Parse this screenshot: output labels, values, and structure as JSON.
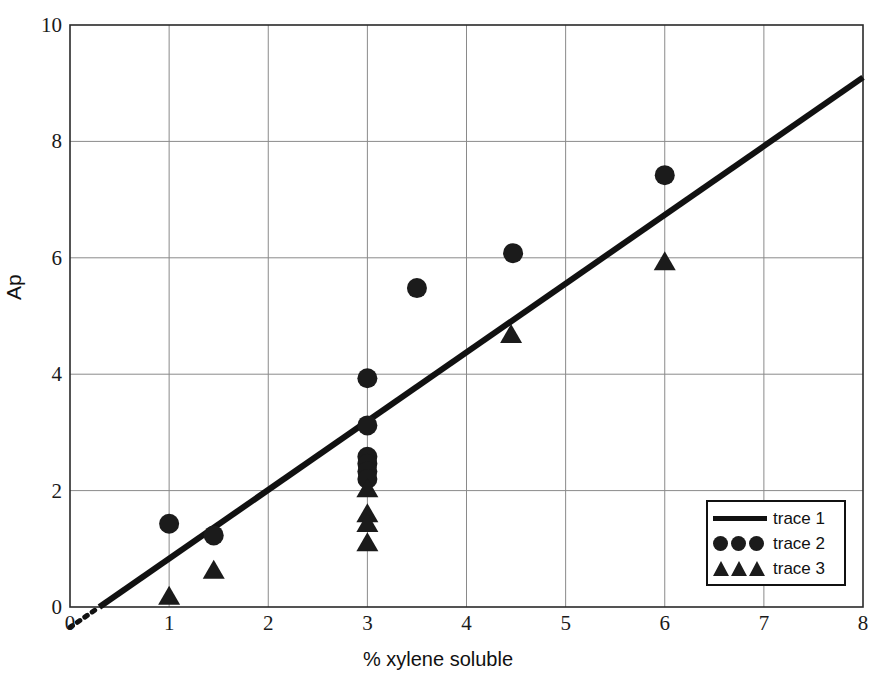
{
  "chart_data": {
    "type": "scatter",
    "title": "",
    "xlabel": "% xylene soluble",
    "ylabel": "Ap",
    "xlim": [
      0,
      8
    ],
    "ylim": [
      0,
      10
    ],
    "xticks": [
      "0",
      "1",
      "2",
      "3",
      "4",
      "5",
      "6",
      "7",
      "8"
    ],
    "yticks": [
      "0",
      "2",
      "4",
      "6",
      "8",
      "10"
    ],
    "grid": true,
    "legend_position": "lower-right",
    "series": [
      {
        "name": "trace 1",
        "type": "line",
        "marker": "line",
        "color": "#111111",
        "points": [
          {
            "x": 0.0,
            "y": -0.35
          },
          {
            "x": 8.0,
            "y": 9.1
          }
        ]
      },
      {
        "name": "trace 2",
        "type": "scatter",
        "marker": "circle",
        "color": "#1b1b1b",
        "points": [
          {
            "x": 1.0,
            "y": 1.43
          },
          {
            "x": 1.45,
            "y": 1.23
          },
          {
            "x": 3.0,
            "y": 3.93
          },
          {
            "x": 3.0,
            "y": 3.12
          },
          {
            "x": 3.0,
            "y": 2.58
          },
          {
            "x": 3.0,
            "y": 2.46
          },
          {
            "x": 3.0,
            "y": 2.33
          },
          {
            "x": 3.0,
            "y": 2.2
          },
          {
            "x": 3.5,
            "y": 5.48
          },
          {
            "x": 4.47,
            "y": 6.08
          },
          {
            "x": 6.0,
            "y": 7.42
          }
        ]
      },
      {
        "name": "trace 3",
        "type": "scatter",
        "marker": "triangle",
        "color": "#1b1b1b",
        "points": [
          {
            "x": 1.0,
            "y": 0.2
          },
          {
            "x": 1.45,
            "y": 0.65
          },
          {
            "x": 3.0,
            "y": 2.05
          },
          {
            "x": 3.0,
            "y": 1.62
          },
          {
            "x": 3.0,
            "y": 1.45
          },
          {
            "x": 3.0,
            "y": 1.12
          },
          {
            "x": 4.45,
            "y": 4.7
          },
          {
            "x": 6.0,
            "y": 5.95
          }
        ]
      }
    ]
  },
  "legend": {
    "entries": [
      {
        "label": "trace 1",
        "key": "line-key"
      },
      {
        "label": "trace 2",
        "key": "circle-key"
      },
      {
        "label": "trace 3",
        "key": "triangle-key"
      }
    ]
  },
  "axis": {
    "y_title": "Ap",
    "x_title": "% xylene soluble"
  }
}
